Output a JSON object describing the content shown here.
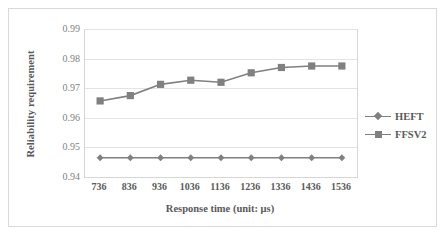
{
  "chart_data": {
    "type": "line",
    "title": "",
    "xlabel": "Response time (unit: μs)",
    "ylabel": "Reliability requirement",
    "categories": [
      "736",
      "836",
      "936",
      "1036",
      "1136",
      "1236",
      "1336",
      "1436",
      "1536"
    ],
    "yticks": [
      "0.94",
      "0.95",
      "0.96",
      "0.97",
      "0.98",
      "0.99"
    ],
    "ylim": [
      0.94,
      0.99
    ],
    "grid": true,
    "legend_position": "right",
    "series": [
      {
        "name": "HEFT",
        "marker": "diamond",
        "color": "#808080",
        "values": [
          0.9465,
          0.9465,
          0.9465,
          0.9465,
          0.9465,
          0.9465,
          0.9465,
          0.9465,
          0.9465
        ]
      },
      {
        "name": "FFSV2",
        "marker": "square",
        "color": "#808080",
        "values": [
          0.9657,
          0.9675,
          0.9713,
          0.9727,
          0.972,
          0.9752,
          0.977,
          0.9775,
          0.9775
        ]
      }
    ]
  },
  "legend": {
    "items": [
      {
        "label": "HEFT",
        "marker": "diamond"
      },
      {
        "label": "FFSV2",
        "marker": "square"
      }
    ]
  },
  "colors": {
    "series": "#808080",
    "grid": "#e3e3e3",
    "text": "#595959",
    "tick_text": "#7f7f7f",
    "border": "#d9d9d9",
    "background": "#ffffff"
  }
}
